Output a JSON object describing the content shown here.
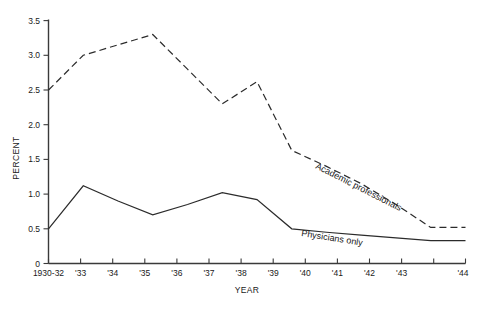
{
  "chart_data": {
    "type": "line",
    "title": "",
    "xlabel": "YEAR",
    "ylabel": "PERCENT",
    "grid": false,
    "legend_position": "inline-along-lines",
    "categories": [
      "1930-32",
      "'33",
      "'34",
      "'35",
      "'36",
      "'37",
      "'38",
      "'39",
      "'40",
      "'41",
      "'42",
      "'43",
      "'44"
    ],
    "xtick_labels": [
      "1930-32",
      "'33",
      "'34",
      "'35",
      "'36",
      "'37",
      "'38",
      "'39",
      "'40",
      "'41",
      "'42",
      "'43",
      "'44"
    ],
    "ytick_labels": [
      "0",
      "0.5",
      "1.0",
      "1.5",
      "2.0",
      "2.5",
      "3.0",
      "3.5"
    ],
    "ytick_values": [
      0,
      0.5,
      1.0,
      1.5,
      2.0,
      2.5,
      3.0,
      3.5
    ],
    "ylim": [
      0,
      3.5
    ],
    "series": [
      {
        "name": "Academic professionals",
        "style": "dashed",
        "values": [
          2.5,
          3.0,
          3.15,
          3.3,
          2.8,
          2.3,
          2.62,
          1.63,
          1.4,
          1.15,
          0.85,
          0.52,
          0.52
        ]
      },
      {
        "name": "Physicians only",
        "style": "solid",
        "values": [
          0.5,
          1.12,
          0.9,
          0.7,
          0.85,
          1.02,
          0.92,
          0.5,
          0.45,
          0.41,
          0.37,
          0.33,
          0.33
        ]
      }
    ],
    "annotations": [
      {
        "text": "Academic professionals",
        "series": "Academic professionals",
        "rotation": 27
      },
      {
        "text": "Physicians only",
        "series": "Physicians only",
        "rotation": 9
      }
    ],
    "colors": {
      "line": "#2b2b2b",
      "axis": "#3a3a3a",
      "text": "#1a1a1a",
      "background": "#ffffff"
    }
  }
}
